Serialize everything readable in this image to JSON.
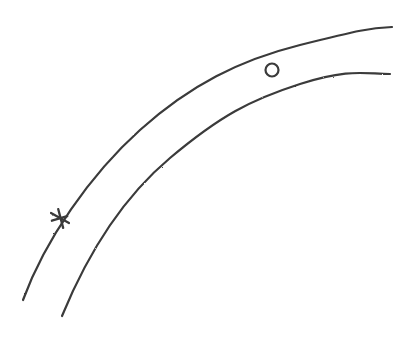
{
  "diagram": {
    "stroke_color": "#3a3a3a",
    "background": "#ffffff",
    "elements": {
      "outer_arc": {
        "path": "M 23 300 C 45 240, 90 175, 140 130 S 240 60, 300 45 S 370 28, 392 27"
      },
      "inner_arc": {
        "path": "M 62 316 C 85 260, 120 200, 170 158 S 250 100, 300 84 S 365 74, 390 74"
      },
      "star": {
        "cx": 60,
        "cy": 218,
        "size": 9
      },
      "circle": {
        "cx": 272,
        "cy": 70,
        "r": 6.5
      }
    }
  }
}
